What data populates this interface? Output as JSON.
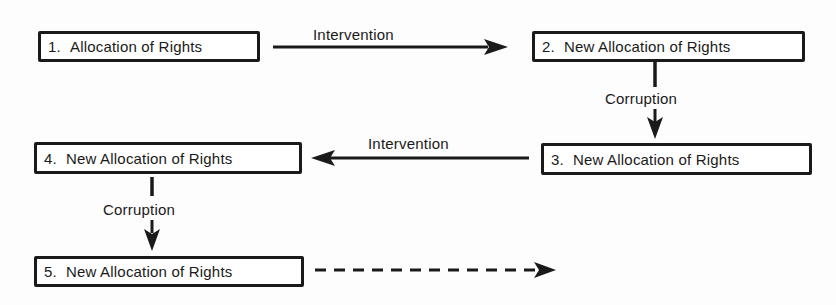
{
  "diagram": {
    "background": "#fdfdfd",
    "stroke_color": "#1a1a1a",
    "nodes": [
      {
        "id": "1",
        "number": "1.",
        "text": "Allocation of Rights"
      },
      {
        "id": "2",
        "number": "2.",
        "text": "New Allocation of Rights"
      },
      {
        "id": "3",
        "number": "3.",
        "text": "New Allocation of Rights"
      },
      {
        "id": "4",
        "number": "4.",
        "text": "New Allocation of Rights"
      },
      {
        "id": "5",
        "number": "5.",
        "text": "New Allocation of Rights"
      }
    ],
    "edges": [
      {
        "from": "1",
        "to": "2",
        "label": "Intervention",
        "style": "solid",
        "direction": "right"
      },
      {
        "from": "2",
        "to": "3",
        "label": "Corruption",
        "style": "solid",
        "direction": "down"
      },
      {
        "from": "3",
        "to": "4",
        "label": "Intervention",
        "style": "solid",
        "direction": "left"
      },
      {
        "from": "4",
        "to": "5",
        "label": "Corruption",
        "style": "solid",
        "direction": "down"
      },
      {
        "from": "5",
        "to": "",
        "label": "",
        "style": "dashed",
        "direction": "right"
      }
    ]
  }
}
